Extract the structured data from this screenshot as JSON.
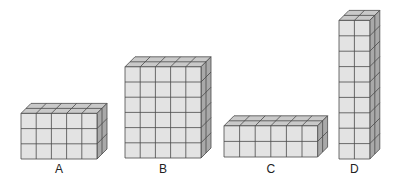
{
  "colors": {
    "front": "#e3e3e3",
    "top": "#c9c9c9",
    "side": "#a9a9a9",
    "line": "#4a4a4a"
  },
  "prisms": [
    {
      "label": "A",
      "cols": 5,
      "rows": 3,
      "depth": 2,
      "x": 21,
      "bottom": 159,
      "cell": 15.2,
      "label_y": 162
    },
    {
      "label": "B",
      "cols": 5,
      "rows": 6,
      "depth": 2,
      "x": 125,
      "bottom": 158,
      "cell": 15.2,
      "label_y": 162
    },
    {
      "label": "C",
      "cols": 6,
      "rows": 2,
      "depth": 2,
      "x": 224,
      "bottom": 157,
      "cell": 15.6,
      "label_y": 162
    },
    {
      "label": "D",
      "cols": 2,
      "rows": 9,
      "depth": 2,
      "x": 339,
      "bottom": 159,
      "cell": 15.4,
      "label_y": 162
    }
  ]
}
